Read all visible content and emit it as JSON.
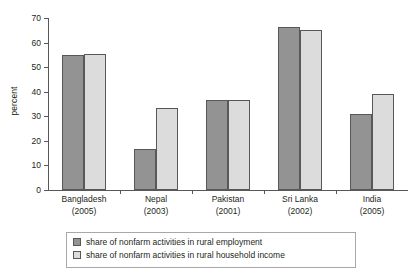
{
  "chart_data": {
    "type": "bar",
    "title": "",
    "xlabel": "",
    "ylabel": "percent",
    "ylim": [
      0,
      70
    ],
    "ytick_step": 10,
    "yticks": [
      0,
      10,
      20,
      30,
      40,
      50,
      60,
      70
    ],
    "grid": false,
    "legend_position": "bottom",
    "categories": [
      "Bangladesh",
      "Nepal",
      "Pakistan",
      "Sri Lanka",
      "India"
    ],
    "category_years": [
      "(2005)",
      "(2003)",
      "(2001)",
      "(2002)",
      "(2005)"
    ],
    "series": [
      {
        "name": "share of nonfarm activities in rural employment",
        "color": "#939393",
        "values": [
          55,
          16.5,
          36.5,
          66.5,
          31
        ]
      },
      {
        "name": "share of nonfarm activities in rural household income",
        "color": "#dcdcdc",
        "values": [
          55.5,
          33.5,
          36.5,
          65,
          39
        ]
      }
    ]
  },
  "colors": {
    "series_dark": "#939393",
    "series_light": "#dcdcdc",
    "axis": "#58585a",
    "text": "#231f20",
    "legend_border": "#a8a8a8",
    "background": "#ffffff"
  }
}
